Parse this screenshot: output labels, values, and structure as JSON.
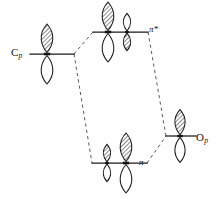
{
  "figure": {
    "kind": "molecular-orbital-interaction-diagram",
    "background_color": "#fefefe",
    "line_color": "#1a1a1a",
    "correlation_line_color": "#59595f",
    "width": 224,
    "height": 199
  },
  "labels": {
    "left_fragment": {
      "symbol": "C",
      "subscript": "p",
      "full": "Cp"
    },
    "right_fragment": {
      "symbol": "O",
      "subscript": "p",
      "full": "Op"
    },
    "antibonding": {
      "text": "π*"
    },
    "bonding": {
      "text": "π"
    }
  },
  "levels": [
    {
      "id": "c-p",
      "name": "carbon-p-orbital-level",
      "label": "Cp",
      "line": {
        "x1": 30,
        "y1": 54,
        "x2": 74,
        "y2": 54
      },
      "orbitals": [
        {
          "cx": 47,
          "cy": 54,
          "scale": 1.0,
          "top": "shaded",
          "bottom": "open"
        }
      ]
    },
    {
      "id": "pi-star",
      "name": "pi-antibonding-level",
      "label": "π*",
      "line": {
        "x1": 93,
        "y1": 32,
        "x2": 148,
        "y2": 32
      },
      "orbitals": [
        {
          "cx": 108,
          "cy": 32,
          "scale": 1.0,
          "top": "shaded",
          "bottom": "open"
        },
        {
          "cx": 127,
          "cy": 32,
          "scale": 0.62,
          "top": "open",
          "bottom": "shaded"
        }
      ]
    },
    {
      "id": "pi",
      "name": "pi-bonding-level",
      "label": "π",
      "line": {
        "x1": 92,
        "y1": 163,
        "x2": 147,
        "y2": 163
      },
      "orbitals": [
        {
          "cx": 107,
          "cy": 163,
          "scale": 0.62,
          "top": "shaded",
          "bottom": "open"
        },
        {
          "cx": 126,
          "cy": 163,
          "scale": 1.0,
          "top": "shaded",
          "bottom": "open"
        }
      ]
    },
    {
      "id": "o-p",
      "name": "oxygen-p-orbital-level",
      "label": "Op",
      "line": {
        "x1": 166,
        "y1": 136,
        "x2": 196,
        "y2": 136
      },
      "orbitals": [
        {
          "cx": 180,
          "cy": 136,
          "scale": 0.88,
          "top": "shaded",
          "bottom": "open"
        }
      ]
    }
  ],
  "correlations": [
    {
      "name": "cp-to-pistar",
      "x1": 74,
      "y1": 54,
      "x2": 93,
      "y2": 32
    },
    {
      "name": "cp-to-pi",
      "x1": 74,
      "y1": 54,
      "x2": 92,
      "y2": 163
    },
    {
      "name": "pistar-to-op",
      "x1": 148,
      "y1": 32,
      "x2": 166,
      "y2": 136
    },
    {
      "name": "pi-to-op",
      "x1": 147,
      "y1": 163,
      "x2": 166,
      "y2": 136
    }
  ]
}
